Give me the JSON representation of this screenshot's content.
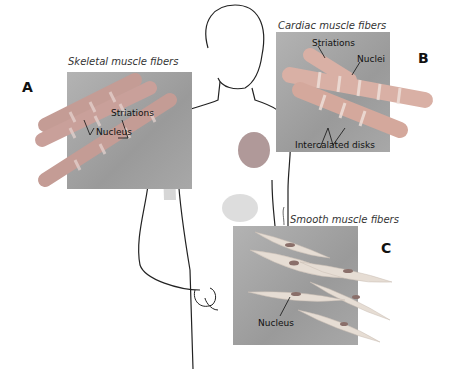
{
  "panels": {
    "skeletal": {
      "letter": "A",
      "title": "Skeletal muscle fibers",
      "labels": {
        "striations": "Striations",
        "nucleus": "Nucleus"
      }
    },
    "cardiac": {
      "letter": "B",
      "title": "Cardiac muscle fibers",
      "labels": {
        "striations": "Striations",
        "nuclei": "Nuclei",
        "intercalated": "Intercalated disks"
      }
    },
    "smooth": {
      "letter": "C",
      "title": "Smooth muscle fibers",
      "labels": {
        "nucleus": "Nucleus"
      }
    }
  },
  "colors": {
    "panel_bg": "#a6a6a6",
    "fiber_skeletal": "#c9a09a",
    "fiber_cardiac": "#d9b0a5",
    "fiber_smooth": "#e6d9cf",
    "outline": "#222222"
  }
}
